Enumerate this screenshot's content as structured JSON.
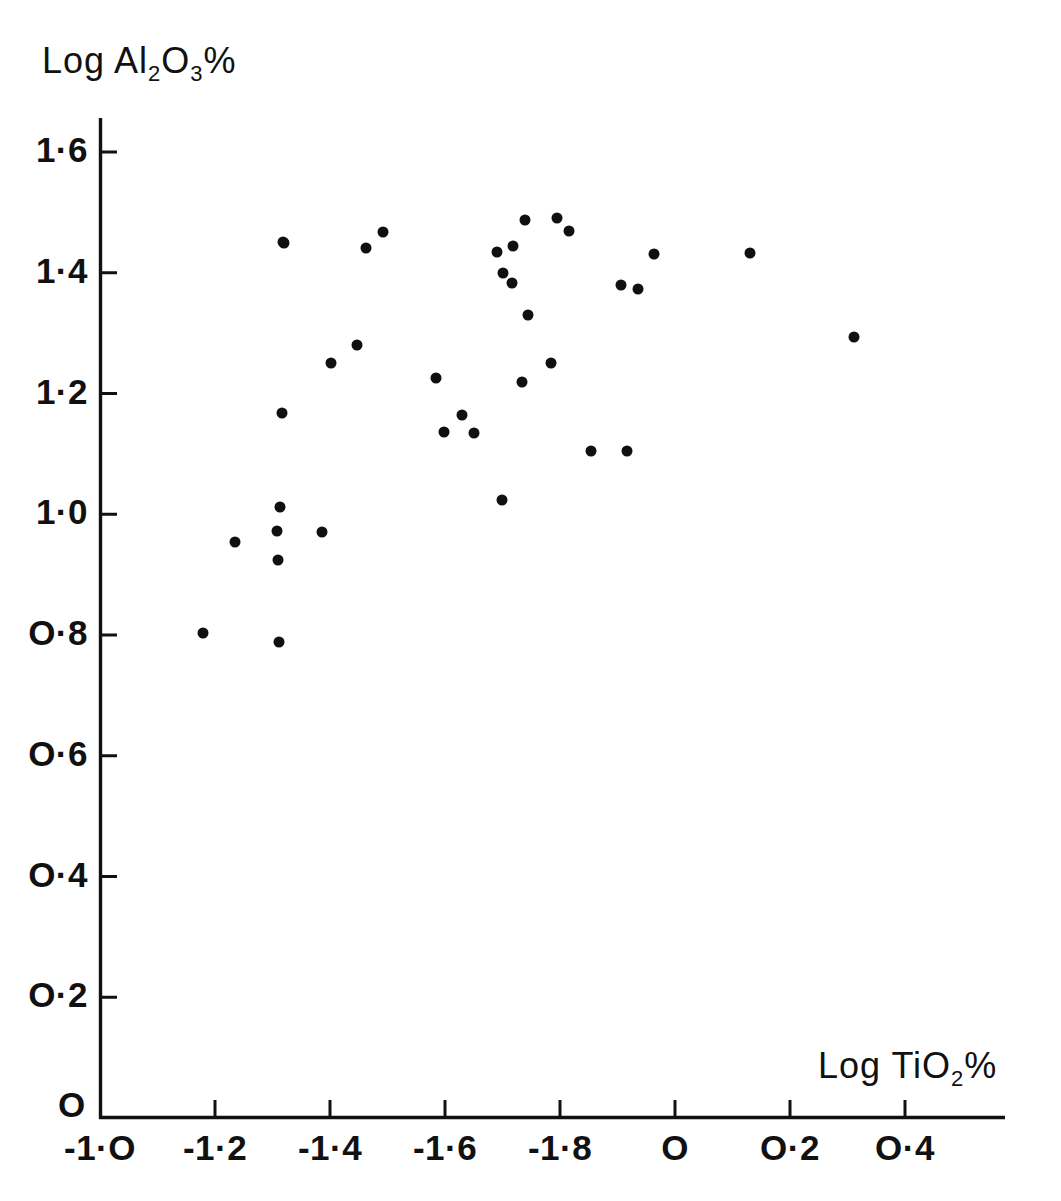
{
  "axes": {
    "y_title_parts": {
      "prefix": "Log Al",
      "sub1": "2",
      "mid": "O",
      "sub2": "3",
      "suffix": "%"
    },
    "x_title_parts": {
      "prefix": "Log TiO",
      "sub1": "2",
      "suffix": "%"
    },
    "y_ticks": [
      "1·6",
      "1·4",
      "1·2",
      "1·0",
      "O·8",
      "O·6",
      "O·4",
      "O·2"
    ],
    "y_origin_label": "O",
    "x_ticks": [
      "-1·O",
      "-1·2",
      "-1·4",
      "-1·6",
      "-1·8",
      "O",
      "O·2",
      "O·4"
    ]
  },
  "chart_data": {
    "type": "scatter",
    "title": "",
    "xlabel": "Log TiO2%",
    "ylabel": "Log Al2O3%",
    "xtick_labels": [
      "-1.0",
      "-1.2",
      "-1.4",
      "-1.6",
      "-1.8",
      "0",
      "0.2",
      "0.4"
    ],
    "xtick_values": [
      -1.0,
      -1.2,
      -1.4,
      -1.6,
      -1.8,
      0.0,
      0.2,
      0.4
    ],
    "ytick_labels": [
      "0",
      "0.2",
      "0.4",
      "0.6",
      "0.8",
      "1.0",
      "1.2",
      "1.4",
      "1.6"
    ],
    "ytick_values": [
      0.0,
      0.2,
      0.4,
      0.6,
      0.8,
      1.0,
      1.2,
      1.4,
      1.6
    ],
    "xlim": [
      -1.0,
      0.47
    ],
    "ylim": [
      0.0,
      1.71
    ],
    "grid": false,
    "legend": null,
    "marker": {
      "shape": "circle",
      "color": "#101010",
      "size_px": 11
    },
    "n_points": 43,
    "points": [
      {
        "x": -1.179,
        "y": 0.81
      },
      {
        "x": -1.213,
        "y": 0.957
      },
      {
        "x": -1.313,
        "y": 1.455
      },
      {
        "x": -1.316,
        "y": 1.168
      },
      {
        "x": -1.313,
        "y": 1.012
      },
      {
        "x": -1.308,
        "y": 0.972
      },
      {
        "x": -1.31,
        "y": 0.924
      },
      {
        "x": -1.308,
        "y": 0.796
      },
      {
        "x": -1.385,
        "y": 0.972
      },
      {
        "x": -1.402,
        "y": 1.25
      },
      {
        "x": -1.445,
        "y": 1.28
      },
      {
        "x": -1.463,
        "y": 1.447
      },
      {
        "x": -1.493,
        "y": 1.474
      },
      {
        "x": -1.585,
        "y": 1.446
      },
      {
        "x": -1.585,
        "y": 1.225
      },
      {
        "x": -1.598,
        "y": 1.164
      },
      {
        "x": -1.629,
        "y": 1.143
      },
      {
        "x": -1.65,
        "y": 1.136
      },
      {
        "x": -1.691,
        "y": 1.024
      },
      {
        "x": -1.692,
        "y": 1.435
      },
      {
        "x": -1.704,
        "y": 1.401
      },
      {
        "x": -1.71,
        "y": 1.381
      },
      {
        "x": -1.716,
        "y": 1.33
      },
      {
        "x": -1.719,
        "y": 1.218
      },
      {
        "x": -1.74,
        "y": 1.487
      },
      {
        "x": -1.745,
        "y": 1.491
      },
      {
        "x": -1.756,
        "y": 1.25
      },
      {
        "x": -1.795,
        "y": 1.497
      },
      {
        "x": -1.816,
        "y": 1.466
      },
      {
        "x": -1.854,
        "y": 1.104
      },
      {
        "x": -1.917,
        "y": 1.104
      },
      {
        "x": -1.906,
        "y": 1.379
      },
      {
        "x": -1.935,
        "y": 1.373
      },
      {
        "x": -1.965,
        "y": 1.43
      },
      {
        "x": -1.131,
        "y": 0.81
      },
      {
        "x": 0.065,
        "y": 1.437
      },
      {
        "x": 0.246,
        "y": 1.293
      }
    ],
    "points_px": [
      [
        284,
        243
      ],
      [
        331,
        363
      ],
      [
        357,
        345
      ],
      [
        366,
        248
      ],
      [
        383,
        232
      ],
      [
        436,
        378
      ],
      [
        462,
        415
      ],
      [
        444,
        432
      ],
      [
        474,
        433
      ],
      [
        502,
        500
      ],
      [
        513,
        246
      ],
      [
        497,
        252
      ],
      [
        503,
        273
      ],
      [
        512,
        283
      ],
      [
        525,
        220
      ],
      [
        528,
        315
      ],
      [
        557,
        218
      ],
      [
        569,
        231
      ],
      [
        551,
        363
      ],
      [
        522,
        382
      ],
      [
        591,
        451
      ],
      [
        627,
        451
      ],
      [
        621,
        285
      ],
      [
        638,
        289
      ],
      [
        654,
        254
      ],
      [
        750,
        253
      ],
      [
        854,
        337
      ],
      [
        280,
        507
      ],
      [
        277,
        531
      ],
      [
        235,
        542
      ],
      [
        322,
        532
      ],
      [
        278,
        560
      ],
      [
        203,
        633
      ],
      [
        279,
        642
      ],
      [
        282,
        413
      ],
      [
        283,
        242
      ]
    ]
  },
  "geometry": {
    "x_axis_px": {
      "x0": 100,
      "x1": 1005,
      "y": 1118,
      "origin_value": -1.0,
      "px_per_0_2": 115
    },
    "y_axis_px": {
      "y0": 118,
      "y1": 1118,
      "x": 100,
      "px_per_0_2": 120.75
    }
  }
}
